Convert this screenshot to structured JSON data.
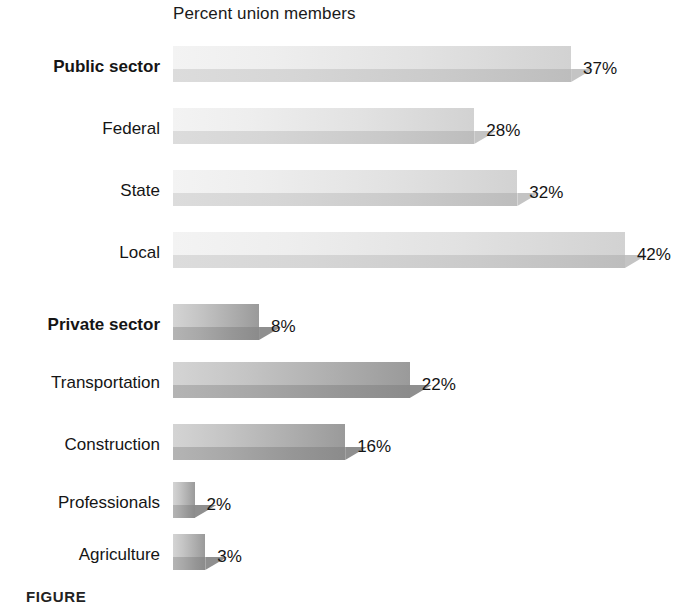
{
  "chart_data": {
    "type": "bar",
    "orientation": "horizontal",
    "title": "Percent union members",
    "xlabel": "",
    "ylabel": "",
    "xlim": [
      0,
      45
    ],
    "grid": false,
    "legend": false,
    "value_suffix": "%",
    "categories": [
      "Public sector",
      "Federal",
      "State",
      "Local",
      "Private sector",
      "Transportation",
      "Construction",
      "Professionals",
      "Agriculture"
    ],
    "values": [
      37,
      28,
      32,
      42,
      8,
      22,
      16,
      2,
      3
    ],
    "value_labels": [
      "37%",
      "28%",
      "32%",
      "42%",
      "8%",
      "22%",
      "16%",
      "2%",
      "3%"
    ],
    "bars": [
      {
        "label": "Public sector",
        "value": 37,
        "value_label": "37%",
        "bold": true,
        "group": "public",
        "tone": "light",
        "top": 46
      },
      {
        "label": "Federal",
        "value": 28,
        "value_label": "28%",
        "bold": false,
        "group": "public",
        "tone": "light",
        "top": 108
      },
      {
        "label": "State",
        "value": 32,
        "value_label": "32%",
        "bold": false,
        "group": "public",
        "tone": "light",
        "top": 170
      },
      {
        "label": "Local",
        "value": 42,
        "value_label": "42%",
        "bold": false,
        "group": "public",
        "tone": "light",
        "top": 232
      },
      {
        "label": "Private sector",
        "value": 8,
        "value_label": "8%",
        "bold": true,
        "group": "private",
        "tone": "dark",
        "top": 304
      },
      {
        "label": "Transportation",
        "value": 22,
        "value_label": "22%",
        "bold": false,
        "group": "private",
        "tone": "dark",
        "top": 362
      },
      {
        "label": "Construction",
        "value": 16,
        "value_label": "16%",
        "bold": false,
        "group": "private",
        "tone": "dark",
        "top": 424
      },
      {
        "label": "Professionals",
        "value": 2,
        "value_label": "2%",
        "bold": false,
        "group": "private",
        "tone": "dark",
        "top": 482
      },
      {
        "label": "Agriculture",
        "value": 3,
        "value_label": "3%",
        "bold": false,
        "group": "private",
        "tone": "dark",
        "top": 534
      }
    ]
  },
  "caption": {
    "text": "FIGURE"
  },
  "colors": {
    "background": "#ffffff",
    "text": "#151515",
    "public_top": "#eeeeee",
    "public_bottom": "#d2d2d2",
    "private_top": "#c5c5c5",
    "private_bottom": "#a0a0a0"
  }
}
